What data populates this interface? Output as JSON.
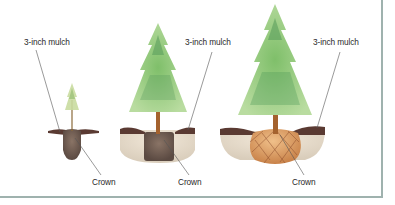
{
  "diagram": {
    "title": "",
    "stages": [
      {
        "name": "bare-root seedling",
        "mulch_label": "3-inch mulch",
        "crown_label": "Crown"
      },
      {
        "name": "container-grown tree",
        "mulch_label": "3-inch mulch",
        "crown_label": "Crown"
      },
      {
        "name": "balled-and-burlapped tree",
        "mulch_label": "3-inch mulch",
        "crown_label": "Crown"
      }
    ],
    "colors": {
      "border": "#9fb2ae",
      "foliage": "#7fbf6a",
      "foliage_dark": "#4f9a5a",
      "mulch": "#5a3a32",
      "soil": "#e8dccb",
      "root_ball": "#6e5a4e",
      "burlap": "#d99a5e",
      "trunk": "#a4622e",
      "leader_line": "#555555"
    }
  }
}
